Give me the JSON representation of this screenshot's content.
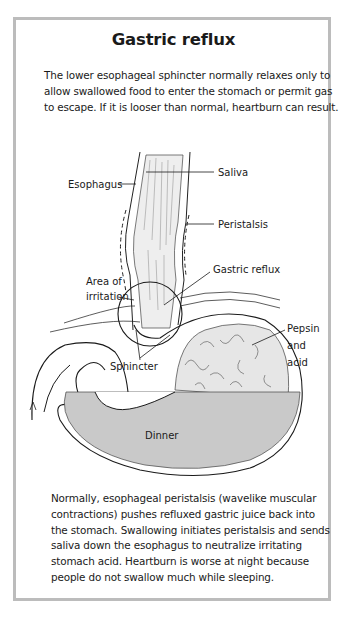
{
  "figure": {
    "title": "Gastric reflux",
    "intro_lines": [
      "The lower esophageal sphincter normally relaxes only to",
      "allow swallowed food to enter the stomach or permit gas",
      "to escape. If it is looser than normal, heartburn can result."
    ],
    "labels": {
      "saliva": "Saliva",
      "esophagus": "Esophagus",
      "peristalsis": "Peristalsis",
      "gastric_reflux": "Gastric reflux",
      "area_of_irritation": [
        "Area of",
        "irritation"
      ],
      "pepsin_and_acid": [
        "Pepsin",
        "and",
        "acid"
      ],
      "sphincter": "Sphincter",
      "dinner": "Dinner"
    },
    "outro_lines": [
      "Normally, esophageal peristalsis (wavelike muscular",
      "contractions) pushes refluxed gastric juice back into",
      "the stomach. Swallowing initiates peristalsis and sends",
      "saliva down the esophagus to neutralize irritating",
      "stomach acid. Heartburn is worse at night because",
      "people do not swallow much while sleeping."
    ],
    "colors": {
      "frame_border": "#bcbcbc",
      "food_fill": "#c9c9c9",
      "acid_fill": "#e4e4e4",
      "ink": "#1a1a1a"
    }
  }
}
